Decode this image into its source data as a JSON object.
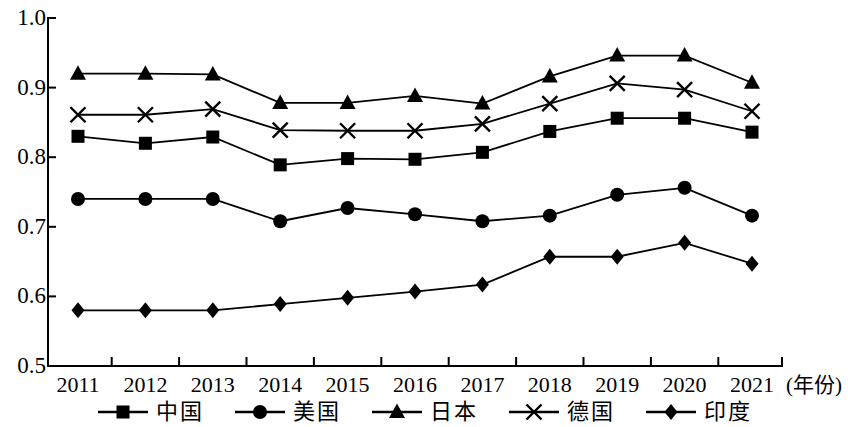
{
  "chart_data": {
    "type": "line",
    "title": "",
    "subtitle": "",
    "xlabel": "(年份)",
    "ylabel": "",
    "x": [
      2011,
      2012,
      2013,
      2014,
      2015,
      2016,
      2017,
      2018,
      2019,
      2020,
      2021
    ],
    "categories": [
      "2011",
      "2012",
      "2013",
      "2014",
      "2015",
      "2016",
      "2017",
      "2018",
      "2019",
      "2020",
      "2021"
    ],
    "xlim": [
      2010.5,
      2021.5
    ],
    "ylim": [
      0.5,
      1.0
    ],
    "yticks": [
      "1.0",
      "0.9",
      "0.8",
      "0.7",
      "0.6",
      "0.5"
    ],
    "ytick_values": [
      1.0,
      0.9,
      0.8,
      0.7,
      0.6,
      0.5
    ],
    "grid": false,
    "legend_position": "bottom",
    "series": [
      {
        "name": "中国",
        "marker": "square",
        "values": [
          0.83,
          0.82,
          0.829,
          0.789,
          0.798,
          0.797,
          0.807,
          0.837,
          0.856,
          0.856,
          0.836
        ]
      },
      {
        "name": "美国",
        "marker": "circle",
        "values": [
          0.74,
          0.74,
          0.74,
          0.708,
          0.727,
          0.718,
          0.708,
          0.716,
          0.746,
          0.756,
          0.716
        ]
      },
      {
        "name": "日本",
        "marker": "triangle",
        "values": [
          0.92,
          0.92,
          0.919,
          0.878,
          0.878,
          0.888,
          0.877,
          0.916,
          0.946,
          0.946,
          0.907
        ]
      },
      {
        "name": "德国",
        "marker": "cross",
        "values": [
          0.861,
          0.861,
          0.869,
          0.839,
          0.838,
          0.838,
          0.848,
          0.877,
          0.906,
          0.897,
          0.866
        ]
      },
      {
        "name": "印度",
        "marker": "diamond",
        "values": [
          0.58,
          0.58,
          0.58,
          0.589,
          0.598,
          0.607,
          0.617,
          0.657,
          0.657,
          0.677,
          0.647
        ]
      }
    ],
    "colors": {
      "line": "#000000",
      "marker": "#000000",
      "axis": "#000000",
      "background": "#ffffff"
    }
  },
  "legend": {
    "items": [
      {
        "label": "中国",
        "marker": "square"
      },
      {
        "label": "美国",
        "marker": "circle"
      },
      {
        "label": "日本",
        "marker": "triangle"
      },
      {
        "label": "德国",
        "marker": "cross"
      },
      {
        "label": "印度",
        "marker": "diamond"
      }
    ]
  }
}
